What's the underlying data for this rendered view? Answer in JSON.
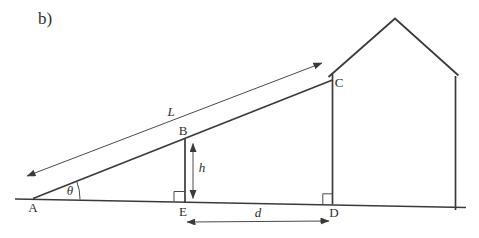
{
  "figure": {
    "part_label": "b)",
    "points": {
      "A": "A",
      "B": "B",
      "C": "C",
      "D": "D",
      "E": "E"
    },
    "measurements": {
      "ramp_length": "L",
      "height": "h",
      "distance": "d",
      "angle": "θ"
    },
    "colors": {
      "line": "#3a3a3a",
      "thin_line": "#4a4a4a",
      "text": "#2e2e2e",
      "background": "#ffffff"
    }
  }
}
